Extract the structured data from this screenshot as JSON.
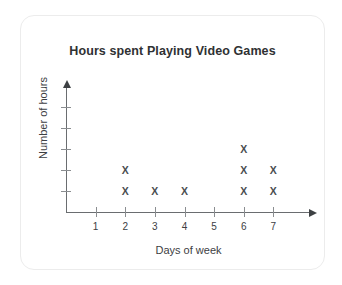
{
  "card": {
    "background": "#ffffff",
    "border_color": "#ececec"
  },
  "chart_data": {
    "type": "scatter",
    "plot_style": "dot-plot-x-markers",
    "title": "Hours spent Playing Video Games",
    "xlabel": "Days of week",
    "ylabel": "Number of hours",
    "categories": [
      "1",
      "2",
      "3",
      "4",
      "5",
      "6",
      "7"
    ],
    "x": [
      1,
      2,
      3,
      4,
      5,
      6,
      7
    ],
    "values": [
      0,
      2,
      1,
      1,
      0,
      3,
      2
    ],
    "series": [
      {
        "name": "Number of hours",
        "values": [
          0,
          2,
          1,
          1,
          0,
          3,
          2
        ]
      }
    ],
    "points": [
      {
        "x": 2,
        "y": 1
      },
      {
        "x": 2,
        "y": 2
      },
      {
        "x": 3,
        "y": 1
      },
      {
        "x": 4,
        "y": 1
      },
      {
        "x": 6,
        "y": 1
      },
      {
        "x": 6,
        "y": 2
      },
      {
        "x": 6,
        "y": 3
      },
      {
        "x": 7,
        "y": 1
      },
      {
        "x": 7,
        "y": 2
      }
    ],
    "marker_glyph": "X",
    "marker_color": "#4a4d50",
    "xlim": [
      0,
      8
    ],
    "ylim": [
      0,
      5
    ],
    "y_ticks": [
      1,
      2,
      3,
      4,
      5
    ],
    "y_tick_labels": [
      "",
      "",
      "",
      "",
      ""
    ],
    "x_tick_labels": [
      "1",
      "2",
      "3",
      "4",
      "5",
      "6",
      "7"
    ],
    "grid": false,
    "legend": false,
    "axis_arrows": true,
    "axis_color": "#6a6d70"
  }
}
